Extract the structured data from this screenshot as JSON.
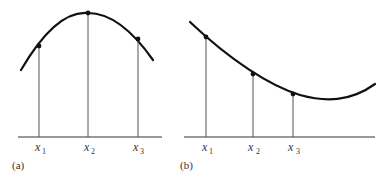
{
  "figure": {
    "panels": [
      {
        "id": "a",
        "caption": "(a)",
        "description": "Concave-down curve (maximum) with three sample points",
        "points": [
          {
            "label": "x",
            "subscript": "1"
          },
          {
            "label": "x",
            "subscript": "2"
          },
          {
            "label": "x",
            "subscript": "3"
          }
        ]
      },
      {
        "id": "b",
        "caption": "(b)",
        "description": "Decreasing convex curve (minimum beyond x3) with three sample points",
        "points": [
          {
            "label": "x",
            "subscript": "1"
          },
          {
            "label": "x",
            "subscript": "2"
          },
          {
            "label": "x",
            "subscript": "3"
          }
        ]
      }
    ]
  }
}
